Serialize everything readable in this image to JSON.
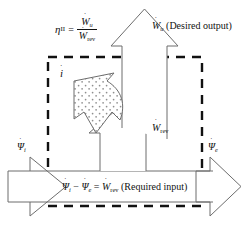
{
  "figure": {
    "name": "second-law-efficiency-exergy-flow-diagram",
    "type": "engineering-schematic",
    "background_color": "#ffffff",
    "line_color": "#111111"
  },
  "efficiency_formula": {
    "symbol": "η",
    "symbol_subscript": "II",
    "equals": "=",
    "numerator_base": "W",
    "numerator_dot": "˙",
    "numerator_subscript": "u",
    "denominator_base": "W",
    "denominator_dot": "˙",
    "denominator_subscript": "rev",
    "plain_text": "η_II = Ẇ_u / Ẇ_rev"
  },
  "labels": {
    "desired_output": {
      "base": "W",
      "dot": "˙",
      "subscript": "u",
      "annotation": "(Desired output)",
      "plain_text": "Ẇ_u (Desired output)"
    },
    "reversible_work": {
      "base": "W",
      "dot": "˙",
      "subscript": "rev",
      "plain_text": "Ẇ_rev"
    },
    "exergy_in": {
      "base": "Ψ",
      "dot": "˙",
      "subscript": "i",
      "plain_text": "Ψ̇_i"
    },
    "exergy_out": {
      "base": "Ψ",
      "dot": "˙",
      "subscript": "e",
      "plain_text": "Ψ̇_e"
    },
    "irreversibility": {
      "base": "i",
      "dot": "˙",
      "plain_text": "i̇"
    }
  },
  "bottom_equation": {
    "term1_base": "Ψ",
    "term1_subscript": "i",
    "minus": "−",
    "term2_base": "Ψ",
    "term2_subscript": "e",
    "equals": "=",
    "term3_base": "W",
    "term3_subscript": "rev",
    "annotation": "(Required input)",
    "plain_text": "Ψ̇_i − Ψ̇_e = Ẇ_rev (Required input)"
  },
  "shapes": {
    "control_volume_boundary": {
      "style": "dashed",
      "x": 48,
      "y": 57,
      "width": 154,
      "height": 149,
      "dash": "9 7",
      "stroke_width": 2.4
    },
    "arrow_up_wu": {
      "direction": "up",
      "label": "Ẇ_u"
    },
    "arrow_up_wrev": {
      "direction": "up",
      "label": "Ẇ_rev"
    },
    "arrow_right_psi_i": {
      "direction": "right",
      "label": "Ψ̇_i"
    },
    "arrow_right_psi_e": {
      "direction": "right",
      "label": "Ψ̇_e"
    },
    "arrow_curved_irreversibility": {
      "direction": "curved-left-up",
      "fill": "stippled",
      "label": "i̇"
    }
  }
}
